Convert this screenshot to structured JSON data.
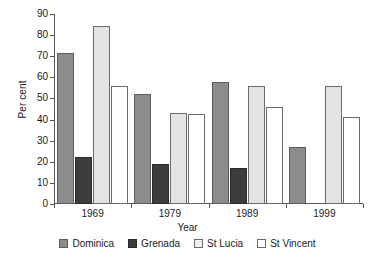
{
  "chart_data": {
    "type": "bar",
    "title": "",
    "xlabel": "Year",
    "ylabel": "Per cent",
    "categories": [
      "1969",
      "1979",
      "1989",
      "1999"
    ],
    "ylim": [
      0,
      90
    ],
    "yticks": [
      0,
      10,
      20,
      30,
      40,
      50,
      60,
      70,
      80,
      90
    ],
    "grid": false,
    "legend_position": "bottom",
    "series": [
      {
        "name": "Dominica",
        "color": "#8c8c8c",
        "values": [
          71.5,
          52,
          58,
          27
        ]
      },
      {
        "name": "Grenada",
        "color": "#3d3d3d",
        "values": [
          22.5,
          19,
          17,
          null
        ]
      },
      {
        "name": "St Lucia",
        "color": "#e3e3e3",
        "values": [
          84.5,
          43,
          56,
          56
        ]
      },
      {
        "name": "St Vincent",
        "color": "#ffffff",
        "values": [
          56,
          42.5,
          46,
          41
        ]
      }
    ]
  }
}
